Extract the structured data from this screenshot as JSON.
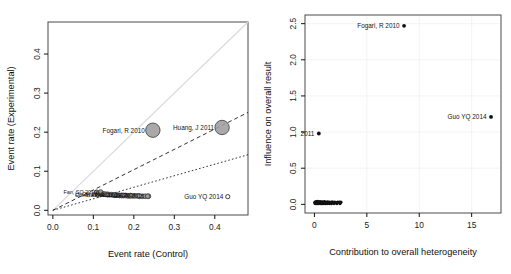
{
  "figure": {
    "caption_faint": "",
    "background": "#ffffff"
  },
  "chart_data": [
    {
      "id": "baujat-left",
      "type": "scatter",
      "title": "",
      "xlabel": "Event rate (Control)",
      "ylabel": "Event rate (Experimental)",
      "xlim": [
        -0.012,
        0.482
      ],
      "ylim": [
        -0.012,
        0.482
      ],
      "xticks": [
        "0.0",
        "0.1",
        "0.2",
        "0.3",
        "0.4"
      ],
      "xtickvals": [
        0.0,
        0.1,
        0.2,
        0.3,
        0.4
      ],
      "yticks": [
        "0.0",
        "0.1",
        "0.2",
        "0.3",
        "0.4"
      ],
      "ytickvals": [
        0.0,
        0.1,
        0.2,
        0.3,
        0.4
      ],
      "grid": false,
      "legend": "none",
      "reference_lines": [
        {
          "name": "identity-line",
          "style": "solid-grey",
          "slope": 1.0,
          "intercept": 0.0,
          "color": "#d9d9d9"
        },
        {
          "name": "upper-dashed-line",
          "style": "dashed",
          "slope": 0.52,
          "intercept": 0.0,
          "color": "#1d1d1d"
        },
        {
          "name": "lower-dotted-line",
          "style": "dotted",
          "slope": 0.295,
          "intercept": 0.0,
          "color": "#1d1d1d"
        }
      ],
      "labeled_points": [
        {
          "label": "Fogari, R 2010",
          "x": 0.247,
          "y": 0.205,
          "size": "large",
          "marker": "bubble",
          "label_side": "left"
        },
        {
          "label": "Huang, J 2011",
          "x": 0.418,
          "y": 0.212,
          "size": "large",
          "marker": "bubble",
          "label_side": "left"
        },
        {
          "label": "Guo YQ 2014",
          "x": 0.432,
          "y": 0.035,
          "size": "tiny",
          "marker": "open",
          "label_side": "left"
        },
        {
          "label": "Fan, SQ 2010",
          "x": 0.118,
          "y": 0.047,
          "size": "tiny",
          "marker": "open",
          "label_side": "left"
        },
        {
          "label": "Li, CH 2010",
          "x": 0.134,
          "y": 0.04,
          "size": "tiny",
          "marker": "open",
          "label_side": "left"
        },
        {
          "label": "Chen, XF 2011",
          "x": 0.152,
          "y": 0.039,
          "size": "tiny",
          "marker": "open",
          "label_side": "left"
        },
        {
          "label": "Wang, L 2012",
          "x": 0.171,
          "y": 0.038,
          "size": "tiny",
          "marker": "open",
          "label_side": "left"
        },
        {
          "label": "Zhao, Y 2013",
          "x": 0.192,
          "y": 0.038,
          "size": "tiny",
          "marker": "open",
          "label_side": "left"
        },
        {
          "label": "Liu, H 2014",
          "x": 0.213,
          "y": 0.037,
          "size": "tiny",
          "marker": "open",
          "label_side": "left"
        },
        {
          "label": "Sun, M 2015",
          "x": 0.234,
          "y": 0.036,
          "size": "tiny",
          "marker": "open",
          "label_side": "left"
        }
      ],
      "cluster_points": [
        [
          0.108,
          0.046
        ],
        [
          0.114,
          0.044
        ],
        [
          0.12,
          0.043
        ],
        [
          0.125,
          0.042
        ],
        [
          0.13,
          0.041
        ],
        [
          0.135,
          0.041
        ],
        [
          0.14,
          0.04
        ],
        [
          0.145,
          0.04
        ],
        [
          0.15,
          0.039
        ],
        [
          0.155,
          0.039
        ],
        [
          0.16,
          0.039
        ],
        [
          0.165,
          0.038
        ],
        [
          0.17,
          0.038
        ],
        [
          0.175,
          0.038
        ],
        [
          0.18,
          0.038
        ],
        [
          0.185,
          0.037
        ],
        [
          0.19,
          0.037
        ],
        [
          0.196,
          0.037
        ],
        [
          0.202,
          0.037
        ],
        [
          0.208,
          0.037
        ],
        [
          0.214,
          0.036
        ],
        [
          0.221,
          0.036
        ],
        [
          0.228,
          0.036
        ],
        [
          0.236,
          0.036
        ]
      ]
    },
    {
      "id": "baujat-right",
      "type": "scatter",
      "title": "",
      "xlabel": "Contribution to overall heterogeneity",
      "ylabel": "Influence on overall result",
      "xlim": [
        -0.9,
        17.8
      ],
      "ylim": [
        -0.12,
        2.62
      ],
      "xticks": [
        "0",
        "5",
        "10",
        "15"
      ],
      "xtickvals": [
        0,
        5,
        10,
        15
      ],
      "yticks": [
        "0.0",
        "0.5",
        "1.0",
        "1.5",
        "2.0",
        "2.5"
      ],
      "ytickvals": [
        0.0,
        0.5,
        1.0,
        1.5,
        2.0,
        2.5
      ],
      "grid": false,
      "legend": "none",
      "labeled_points": [
        {
          "label": "Fogari, R 2010",
          "x": 8.55,
          "y": 2.47,
          "marker": "dot",
          "label_side": "left"
        },
        {
          "label": "Guo YQ 2014",
          "x": 16.85,
          "y": 1.21,
          "marker": "dot",
          "label_side": "left"
        },
        {
          "label": "2011",
          "x": 0.42,
          "y": 0.98,
          "marker": "dot",
          "label_side": "left",
          "clipped": true
        }
      ],
      "cluster_points": [
        [
          0.05,
          0.03
        ],
        [
          0.1,
          0.022
        ],
        [
          0.16,
          0.035
        ],
        [
          0.22,
          0.018
        ],
        [
          0.28,
          0.04
        ],
        [
          0.34,
          0.025
        ],
        [
          0.4,
          0.032
        ],
        [
          0.46,
          0.02
        ],
        [
          0.52,
          0.038
        ],
        [
          0.58,
          0.028
        ],
        [
          0.64,
          0.022
        ],
        [
          0.7,
          0.034
        ],
        [
          0.76,
          0.026
        ],
        [
          0.82,
          0.03
        ],
        [
          0.88,
          0.02
        ],
        [
          0.95,
          0.036
        ],
        [
          1.02,
          0.024
        ],
        [
          1.1,
          0.03
        ],
        [
          1.18,
          0.022
        ],
        [
          1.26,
          0.034
        ],
        [
          1.36,
          0.026
        ],
        [
          1.46,
          0.03
        ],
        [
          1.56,
          0.024
        ],
        [
          1.68,
          0.032
        ],
        [
          1.8,
          0.026
        ],
        [
          1.94,
          0.03
        ],
        [
          2.08,
          0.024
        ],
        [
          2.22,
          0.03
        ],
        [
          2.38,
          0.028
        ],
        [
          2.52,
          0.03
        ],
        [
          0.07,
          0.012
        ],
        [
          0.19,
          0.01
        ],
        [
          0.31,
          0.012
        ],
        [
          0.43,
          0.01
        ],
        [
          0.55,
          0.012
        ],
        [
          0.67,
          0.01
        ],
        [
          0.79,
          0.012
        ],
        [
          0.91,
          0.01
        ],
        [
          1.05,
          0.012
        ],
        [
          1.22,
          0.01
        ],
        [
          1.42,
          0.012
        ],
        [
          1.62,
          0.01
        ],
        [
          1.86,
          0.012
        ],
        [
          2.14,
          0.01
        ],
        [
          2.44,
          0.012
        ]
      ]
    }
  ]
}
